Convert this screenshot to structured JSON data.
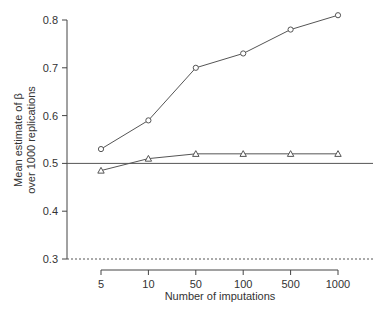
{
  "chart_data": {
    "type": "line",
    "title": "",
    "xlabel": "Number of imputations",
    "ylabel_lines": [
      "Mean estimate of β",
      "over 1000 replications"
    ],
    "ylabel": "Mean estimate of β over 1000 replications",
    "categories": [
      "5",
      "10",
      "50",
      "100",
      "500",
      "1000"
    ],
    "series": [
      {
        "name": "circle-series",
        "marker": "circle",
        "values": [
          0.53,
          0.59,
          0.7,
          0.73,
          0.78,
          0.81
        ]
      },
      {
        "name": "triangle-series",
        "marker": "triangle",
        "values": [
          0.485,
          0.51,
          0.52,
          0.52,
          0.52,
          0.52
        ]
      }
    ],
    "reference_lines": [
      {
        "y": 0.5,
        "style": "solid"
      },
      {
        "y": 0.3,
        "style": "dotted"
      }
    ],
    "yticks": [
      "0.3",
      "0.4",
      "0.5",
      "0.6",
      "0.7",
      "0.8"
    ],
    "ylim": [
      0.3,
      0.8
    ],
    "grid": false,
    "legend": "none",
    "colors": {
      "line": "#555555",
      "axis": "#444444",
      "text": "#333333"
    }
  }
}
